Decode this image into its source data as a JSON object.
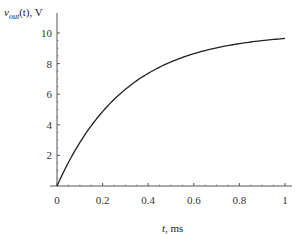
{
  "chart_data": {
    "type": "line",
    "title": "",
    "xlabel": "t, ms",
    "ylabel": "v_out(t), V",
    "ylabel_parts": {
      "var": "v",
      "sub": "out",
      "rest": "(t), V"
    },
    "xlabel_parts": {
      "var": "t",
      "rest": ", ms"
    },
    "xlim": [
      0,
      1
    ],
    "ylim": [
      0,
      11
    ],
    "x_ticks": [
      0,
      0.2,
      0.4,
      0.6,
      0.8,
      1
    ],
    "x_tick_labels": [
      "0",
      "0.2",
      "0.4",
      "0.6",
      "0.8",
      "1"
    ],
    "y_ticks": [
      2,
      4,
      6,
      8,
      10
    ],
    "y_tick_labels": [
      "2",
      "4",
      "6",
      "8",
      "10"
    ],
    "grid": false,
    "legend": null,
    "series": [
      {
        "name": "v_out(t)",
        "formula": "10*(1-exp(-t/0.3))",
        "x": [
          0,
          0.05,
          0.1,
          0.15,
          0.2,
          0.25,
          0.3,
          0.35,
          0.4,
          0.45,
          0.5,
          0.55,
          0.6,
          0.65,
          0.7,
          0.75,
          0.8,
          0.85,
          0.9,
          0.95,
          1.0
        ],
        "values": [
          0,
          1.54,
          2.83,
          3.93,
          4.87,
          5.65,
          6.32,
          6.89,
          7.36,
          7.77,
          8.11,
          8.4,
          8.65,
          8.85,
          9.03,
          9.18,
          9.31,
          9.41,
          9.5,
          9.58,
          9.64
        ]
      }
    ],
    "colors": {
      "line": "#222222",
      "axis": "#555555"
    }
  }
}
